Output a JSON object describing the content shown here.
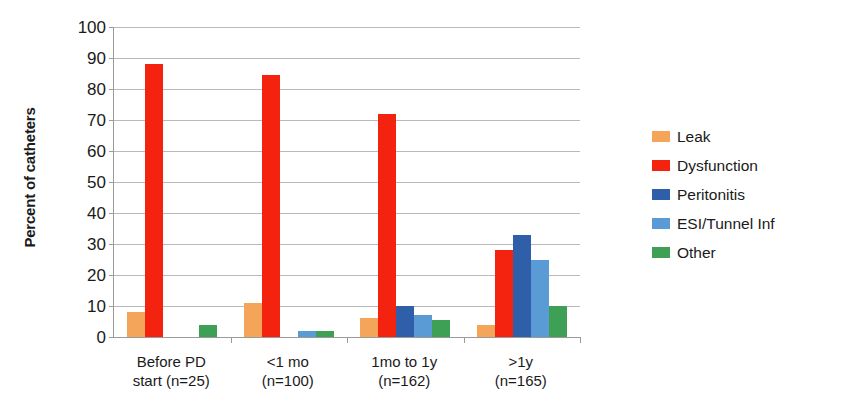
{
  "chart_data": {
    "type": "bar",
    "title": "",
    "subtitle": "",
    "xlabel": "",
    "ylabel": "Percent of catheters",
    "ylim": [
      0,
      100
    ],
    "ytick_step": 10,
    "yticks": [
      0,
      10,
      20,
      30,
      40,
      50,
      60,
      70,
      80,
      90,
      100
    ],
    "ytick_labels": [
      "0",
      "10",
      "20",
      "30",
      "40",
      "50",
      "60",
      "70",
      "80",
      "90",
      "100"
    ],
    "grid": "horizontal",
    "legend_position": "right",
    "categories": [
      "Before PD\nstart (n=25)",
      "<1 mo\n(n=100)",
      "1mo to 1y\n(n=162)",
      ">1y\n(n=165)"
    ],
    "category_lines": [
      [
        "Before PD",
        "start (n=25)"
      ],
      [
        "<1 mo",
        "(n=100)"
      ],
      [
        "1mo to 1y",
        "(n=162)"
      ],
      [
        ">1y",
        "(n=165)"
      ]
    ],
    "series": [
      {
        "name": "Leak",
        "color": "#F5A55A",
        "values": [
          8,
          11,
          6,
          4
        ]
      },
      {
        "name": "Dysfunction",
        "color": "#F42310",
        "values": [
          88,
          84.5,
          72,
          28
        ]
      },
      {
        "name": "Peritonitis",
        "color": "#2E5FA8",
        "values": [
          0,
          0,
          10,
          33
        ]
      },
      {
        "name": "ESI/Tunnel Inf",
        "color": "#5B9BD5",
        "values": [
          0,
          2,
          7,
          25
        ]
      },
      {
        "name": "Other",
        "color": "#3EA055",
        "values": [
          4,
          2,
          5.5,
          10
        ]
      }
    ]
  },
  "legend": {
    "items": [
      {
        "label": "Leak",
        "color": "#F5A55A"
      },
      {
        "label": "Dysfunction",
        "color": "#F42310"
      },
      {
        "label": "Peritonitis",
        "color": "#2E5FA8"
      },
      {
        "label": "ESI/Tunnel Inf",
        "color": "#5B9BD5"
      },
      {
        "label": "Other",
        "color": "#3EA055"
      }
    ]
  },
  "axes": {
    "y_title": "Percent of catheters"
  }
}
